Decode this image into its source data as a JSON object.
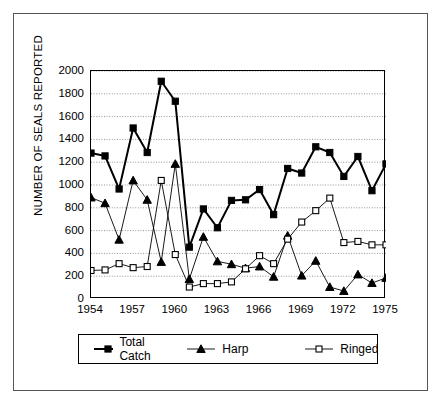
{
  "chart_data": {
    "type": "line",
    "title": "",
    "xlabel": "",
    "ylabel": "NUMBER OF SEALS REPORTED",
    "x": [
      1954,
      1955,
      1956,
      1957,
      1958,
      1959,
      1960,
      1961,
      1962,
      1963,
      1964,
      1965,
      1966,
      1967,
      1968,
      1969,
      1970,
      1971,
      1972,
      1973,
      1974,
      1975
    ],
    "xlim": [
      1954,
      1975
    ],
    "ylim": [
      0,
      2000
    ],
    "yticks": [
      0,
      200,
      400,
      600,
      800,
      1000,
      1200,
      1400,
      1600,
      1800,
      2000
    ],
    "xticks": [
      1954,
      1957,
      1960,
      1963,
      1966,
      1969,
      1972,
      1975
    ],
    "grid": "horizontal-dotted",
    "legend_position": "below",
    "series": [
      {
        "name": "Total Catch",
        "marker": "filled-square",
        "color": "#000000",
        "values": [
          1280,
          1255,
          965,
          1500,
          1285,
          1910,
          1735,
          455,
          790,
          625,
          865,
          870,
          960,
          740,
          1145,
          1105,
          1335,
          1285,
          1075,
          1250,
          950,
          1185
        ]
      },
      {
        "name": "Harp",
        "marker": "filled-triangle",
        "color": "#000000",
        "values": [
          890,
          840,
          520,
          1040,
          870,
          325,
          1185,
          175,
          545,
          330,
          305,
          270,
          285,
          195,
          555,
          205,
          335,
          105,
          70,
          215,
          140,
          185
        ]
      },
      {
        "name": "Ringed",
        "marker": "open-square",
        "color": "#000000",
        "values": [
          250,
          255,
          310,
          275,
          285,
          1040,
          390,
          105,
          135,
          135,
          150,
          265,
          380,
          310,
          525,
          675,
          775,
          885,
          495,
          505,
          475,
          475
        ]
      }
    ]
  },
  "legend": {
    "items": [
      {
        "label": "Total Catch"
      },
      {
        "label": "Harp"
      },
      {
        "label": "Ringed"
      }
    ]
  },
  "axes": {
    "y_title": "NUMBER OF SEALS REPORTED"
  }
}
